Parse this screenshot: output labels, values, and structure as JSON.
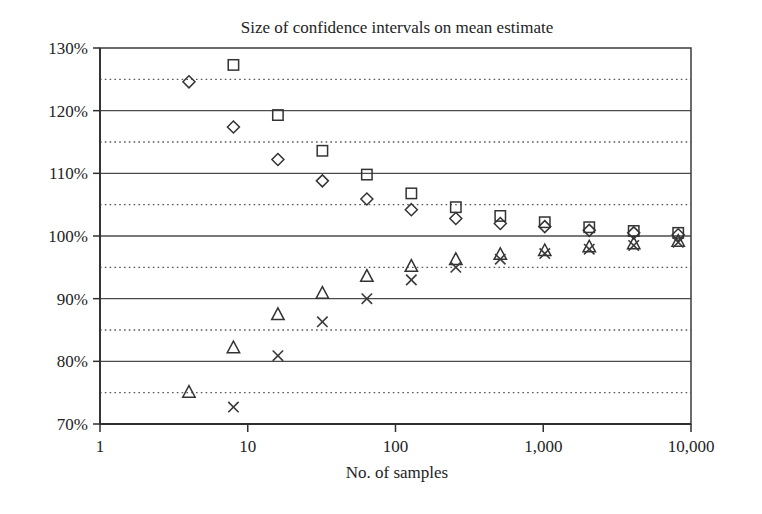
{
  "chart_data": {
    "type": "scatter",
    "title": "Size of confidence intervals on mean estimate",
    "xlabel": "No. of samples",
    "ylabel": "",
    "xscale": "log",
    "xlim": [
      1,
      10000
    ],
    "ylim": [
      70,
      130
    ],
    "grid": "horizontal major solid every 10%, minor dotted every 5%",
    "legend": "none",
    "x_tick_labels": [
      "1",
      "10",
      "100",
      "1,000",
      "10,000"
    ],
    "x_tick_values": [
      1,
      10,
      100,
      1000,
      10000
    ],
    "y_tick_labels": [
      "70%",
      "80%",
      "90%",
      "100%",
      "110%",
      "120%",
      "130%"
    ],
    "y_tick_values": [
      70,
      80,
      90,
      100,
      110,
      120,
      130
    ],
    "y_minor_values": [
      75,
      85,
      95,
      105,
      115,
      125
    ],
    "x": [
      4,
      8,
      16,
      32,
      64,
      128,
      256,
      512,
      1024,
      2048,
      4096,
      8192
    ],
    "series": [
      {
        "name": "upper-square",
        "marker": "square",
        "x": [
          8,
          16,
          32,
          64,
          128,
          256,
          512,
          1024,
          2048,
          4096,
          8192
        ],
        "values": [
          127.3,
          119.3,
          113.6,
          109.8,
          106.8,
          104.6,
          103.2,
          102.2,
          101.4,
          100.8,
          100.5
        ]
      },
      {
        "name": "upper-diamond",
        "marker": "diamond",
        "x": [
          4,
          8,
          16,
          32,
          64,
          128,
          256,
          512,
          1024,
          2048,
          4096,
          8192
        ],
        "values": [
          124.6,
          117.4,
          112.2,
          108.8,
          105.9,
          104.2,
          102.8,
          102.0,
          101.5,
          100.9,
          100.5,
          100.2
        ]
      },
      {
        "name": "lower-triangle",
        "marker": "triangle",
        "x": [
          4,
          8,
          16,
          32,
          64,
          128,
          256,
          512,
          1024,
          2048,
          4096,
          8192
        ],
        "values": [
          75.1,
          82.2,
          87.5,
          90.9,
          93.6,
          95.2,
          96.3,
          97.1,
          97.7,
          98.3,
          98.8,
          99.2
        ]
      },
      {
        "name": "lower-cross",
        "marker": "x",
        "x": [
          8,
          16,
          32,
          64,
          128,
          256,
          512,
          1024,
          2048,
          4096,
          8192
        ],
        "values": [
          72.7,
          80.9,
          86.3,
          90.0,
          93.0,
          95.0,
          96.3,
          97.2,
          97.9,
          98.5,
          99.0
        ]
      }
    ]
  },
  "colors": {
    "background": "#ffffff",
    "ink": "#2f2f2f",
    "grid_major": "#4c4c4c",
    "grid_minor": "#5a5a5a"
  }
}
